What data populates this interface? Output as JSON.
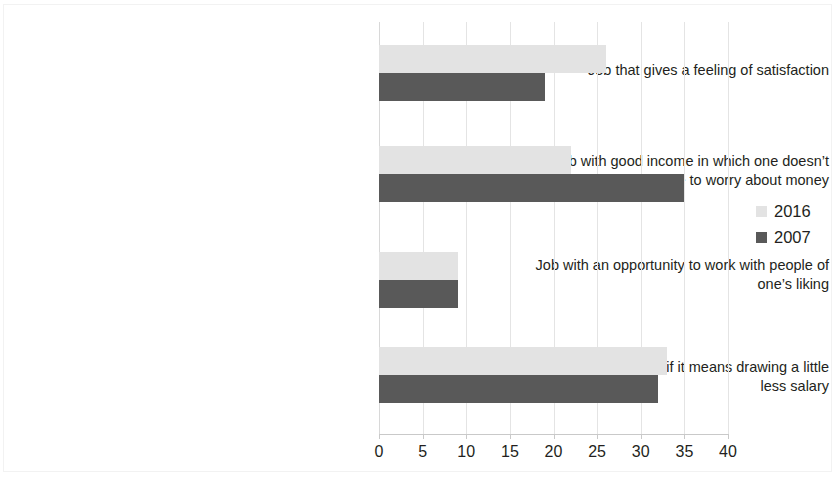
{
  "chart_data": {
    "type": "bar",
    "orientation": "horizontal",
    "title": "",
    "subtitle": "",
    "xlabel": "",
    "ylabel": "",
    "xlim": [
      0,
      40
    ],
    "xticks": [
      0,
      5,
      10,
      15,
      20,
      25,
      30,
      35,
      40
    ],
    "grid": true,
    "legend_position": "right",
    "categories": [
      "Job that gives a feeling of satisfaction",
      "Job with good income in which one doesn’t\nhave to worry about money",
      "Job with an opportunity to work with people of\none’s liking",
      "Permanent job even if it means drawing a little\nless salary"
    ],
    "series": [
      {
        "name": "2016",
        "color": "#e3e3e3",
        "values": [
          26,
          22,
          9,
          33
        ]
      },
      {
        "name": "2007",
        "color": "#595959",
        "values": [
          19,
          35,
          9,
          32
        ]
      }
    ]
  },
  "legend": {
    "items": [
      {
        "label": "2016",
        "swatch_color": "#e3e3e3"
      },
      {
        "label": "2007",
        "swatch_color": "#595959"
      }
    ]
  },
  "axis": {
    "tick_labels": [
      "0",
      "5",
      "10",
      "15",
      "20",
      "25",
      "30",
      "35",
      "40"
    ]
  }
}
